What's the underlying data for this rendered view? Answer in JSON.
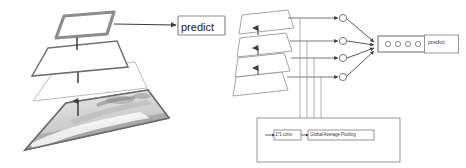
{
  "figure": {
    "background_color": "#ffffff",
    "panels": [
      {
        "name": "left-panel",
        "description": "Stacked convolutional feature map planes with image at bottom feeding a predict box",
        "predict_label": "predict",
        "plane_count": 4,
        "arrow_count": 3
      },
      {
        "name": "right-panel",
        "description": "Stacked feature map planes routed through 1*1 conv and Global Average Pooling into nodes, feature vector and predict box",
        "predict_label": "predict",
        "plane_count": 4,
        "node_count": 4,
        "feature_vector_circles": 4,
        "conv_label": "1*1 conv",
        "pooling_label": "Global Average Pooling"
      }
    ]
  },
  "colors": {
    "stroke": "#6f6f6f",
    "stroke_dark": "#4a4a4a",
    "stroke_light": "#9a9a9a",
    "plane_fill": "#ffffff",
    "top_plane_border": "#8a8a8a",
    "image_gray_light": "#d8d8d8",
    "image_gray_mid": "#a8a8a8",
    "image_gray_dark": "#7c7c7c",
    "text": "#222222"
  }
}
